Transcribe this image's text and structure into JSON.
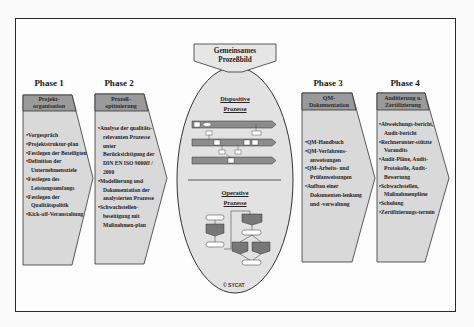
{
  "diagram": {
    "center": {
      "label_line1": "Gemeinsames",
      "label_line2": "Prozeßbild",
      "dispositive_line1": "Dispositive",
      "dispositive_line2": "Prozesse",
      "operative_line1": "Operative",
      "operative_line2": "Prozesse",
      "copyright": "© SYCAT"
    },
    "phases": [
      {
        "title": "Phase 1",
        "header_line1": "Projekt-",
        "header_line2": "organisation",
        "items": [
          "Vorgespräch",
          "Projektstruktur-plan",
          "Festlegen der Beteiligten",
          "Definition der Unternehmensziele",
          "Festlegen des Leistungsumfangs",
          "Festlegen der Qualitätspolitik",
          "Kick-off-Veranstaltung"
        ]
      },
      {
        "title": "Phase 2",
        "header_line1": "Prozeß-",
        "header_line2": "optimierung",
        "items": [
          "Analyse der qualitäts-relevanten Prozesse unter Berücksichtigung der DIN EN ISO 9000ff / 2000",
          "Modellierung und Dokumentation der analysierten Prozesse",
          "Schwachstellen-beseitigung mit Maßnahmen-plan"
        ]
      },
      {
        "title": "Phase 3",
        "header_line1": "QM-",
        "header_line2": "Dokumentation",
        "items": [
          "QM-Handbuch",
          "QM-Verfahrens-anweisungen",
          "QM-Arbeits- und Prüfanweisungen",
          "Aufbau einer Dokumenten-lenkung und -verwaltung"
        ]
      },
      {
        "title": "Phase 4",
        "header_line1": "Auditierung u.",
        "header_line2": "Zertifizierung",
        "items": [
          "Abweichungs-bericht, Audit-bericht",
          "Rechnerunter-stützte Voraudits",
          "Audit-Pläne, Audit-Protokolle, Audit-Bewertung",
          "Schwachstellen, Maßnahmenpläne",
          "Schulung",
          "Zertifizierungs-termin"
        ]
      }
    ],
    "colors": {
      "arrow_fill": "#d9d9d9",
      "header_fill": "#9a9a9a",
      "ellipse_fill": "#e2e2e2",
      "stroke": "#333333",
      "swimlane_fill": "#8c8c8c"
    }
  }
}
